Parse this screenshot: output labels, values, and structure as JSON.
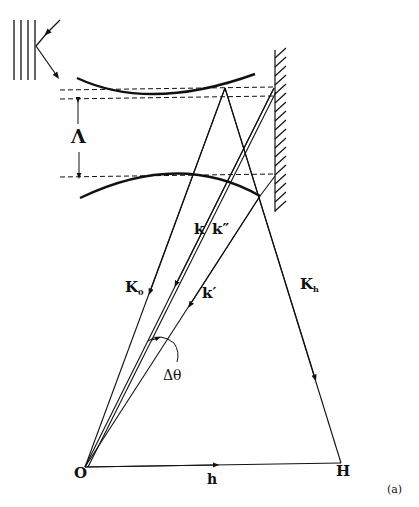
{
  "figure": {
    "panel_label": "(a)",
    "labels": {
      "lambda": "Λ",
      "k": "k",
      "k_double_prime": "k″",
      "k_prime": "k′",
      "K0_main": "K",
      "K0_sub": "0",
      "Kh_main": "K",
      "Kh_sub": "h",
      "delta_theta": "Δθ",
      "origin": "O",
      "reciprocal_point": "H",
      "h_vector": "h"
    },
    "colors": {
      "ink": "#111111",
      "background": "#ffffff"
    }
  }
}
